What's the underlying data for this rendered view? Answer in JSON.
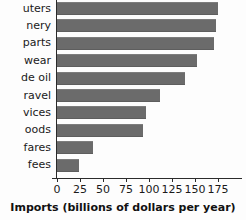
{
  "chart_data": {
    "type": "bar",
    "orientation": "horizontal",
    "title": "",
    "xlabel": "Imports (billions of dollars per year)",
    "ylabel": "",
    "xlim": [
      0,
      175
    ],
    "xticks": [
      0,
      25,
      50,
      75,
      100,
      125,
      150,
      175
    ],
    "grid": false,
    "legend": null,
    "bar_color": "#6b6b6b",
    "categories": [
      "uters",
      "nery",
      "parts",
      "wear",
      "de oil",
      "ravel",
      "vices",
      "oods",
      "fares",
      "fees"
    ],
    "values": [
      175,
      173,
      171,
      152,
      139,
      112,
      97,
      94,
      39,
      24
    ]
  },
  "axis": {
    "title": "Imports (billions of dollars per year)"
  }
}
